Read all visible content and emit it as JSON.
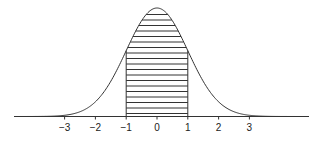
{
  "chart_data": {
    "type": "area",
    "title": "",
    "xlabel": "",
    "ylabel": "",
    "distribution": {
      "name": "standard normal",
      "mean": 0,
      "sd": 1
    },
    "shaded_region": {
      "from": -1,
      "to": 1,
      "pattern": "horizontal-lines"
    },
    "x_ticks": [
      -3,
      -2,
      -1,
      0,
      1,
      2,
      3
    ],
    "x_tick_labels": [
      "−3",
      "−2",
      "−1",
      "0",
      "1",
      "2",
      "3"
    ],
    "xlim": [
      -4.6,
      4.9
    ],
    "grid": false,
    "legend": null
  },
  "colors": {
    "line": "#333333",
    "background": "#ffffff"
  }
}
